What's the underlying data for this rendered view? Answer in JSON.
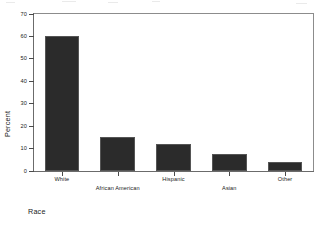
{
  "chart_data": {
    "type": "bar",
    "title": "",
    "xlabel": "Race",
    "ylabel": "Percent",
    "categories": [
      "White",
      "African American",
      "Hispanic",
      "Asian",
      "Other"
    ],
    "values": [
      60,
      15,
      12,
      7.5,
      4
    ],
    "ylim": [
      0,
      70
    ],
    "yticks": [
      0,
      10,
      20,
      30,
      40,
      50,
      60,
      70
    ],
    "ytick_labels": [
      "0",
      "10",
      "20",
      "30",
      "40",
      "50",
      "60",
      "70"
    ],
    "grid": false,
    "legend": false,
    "bar_color": "#2b2b2b",
    "bar_edge_color": "#555555",
    "axis_color": "#6b6b6b",
    "label_rows": [
      0,
      1,
      0,
      1,
      0
    ]
  }
}
